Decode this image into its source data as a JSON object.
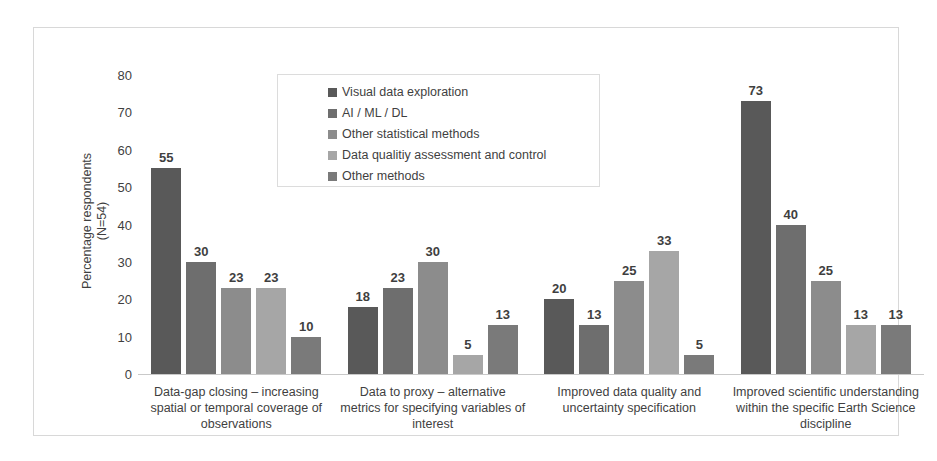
{
  "chart_data": {
    "type": "bar",
    "title": "",
    "xlabel": "",
    "ylabel": "Percentage respondents\n(N=54)",
    "ylim": [
      0,
      80
    ],
    "ytick_step": 10,
    "yticks": [
      80,
      70,
      60,
      50,
      40,
      30,
      20,
      10,
      0
    ],
    "grid": false,
    "legend_position": "inside-top-center",
    "categories": [
      "Data-gap closing – increasing spatial or temporal coverage of observations",
      "Data to proxy – alternative metrics for specifying variables of interest",
      "Improved data quality and uncertainty specification",
      "Improved scientific understanding within the specific Earth Science discipline"
    ],
    "series": [
      {
        "name": "Visual data exploration",
        "color": "#595959",
        "values": [
          55,
          18,
          20,
          73
        ]
      },
      {
        "name": "AI / ML / DL",
        "color": "#6e6e6e",
        "values": [
          30,
          23,
          13,
          40
        ]
      },
      {
        "name": "Other statistical methods",
        "color": "#8c8c8c",
        "values": [
          23,
          30,
          25,
          25
        ]
      },
      {
        "name": "Data qualitiy assessment and control",
        "color": "#a6a6a6",
        "values": [
          23,
          5,
          33,
          13
        ]
      },
      {
        "name": "Other methods",
        "color": "#7a7a7a",
        "values": [
          10,
          13,
          5,
          13
        ]
      }
    ]
  },
  "colors": {
    "frame_border": "#d8d8d8",
    "axis_line": "#c9c9c9",
    "text": "#3f3f3f",
    "legend_border": "#dcdcdc",
    "background": "#ffffff"
  }
}
